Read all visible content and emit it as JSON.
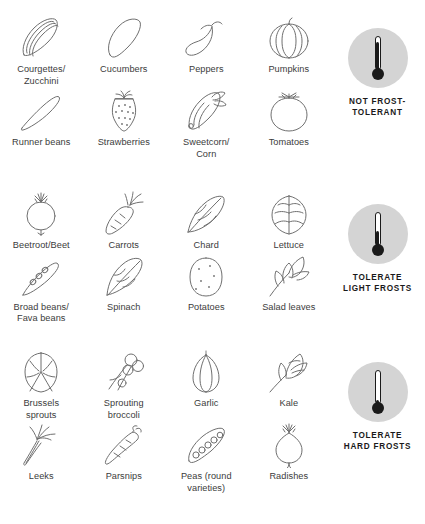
{
  "colors": {
    "stroke": "#6f6f6f",
    "text": "#3b3b3b",
    "legend_text": "#1a1a1a",
    "circle_bg": "#d4d4d4",
    "mercury": "#1a1a1a",
    "background": "#ffffff"
  },
  "sections": [
    {
      "id": "not-frost-tolerant",
      "legend": {
        "label": "NOT FROST-\nTOLERANT",
        "thermometer_level_percent": 95,
        "icon": "thermometer-hot-icon"
      },
      "items": [
        {
          "name": "courgettes-zucchini",
          "label": "Courgettes/\nZucchini",
          "icon": "courgette-icon"
        },
        {
          "name": "cucumbers",
          "label": "Cucumbers",
          "icon": "cucumber-icon"
        },
        {
          "name": "peppers",
          "label": "Peppers",
          "icon": "pepper-icon"
        },
        {
          "name": "pumpkins",
          "label": "Pumpkins",
          "icon": "pumpkin-icon"
        },
        {
          "name": "runner-beans",
          "label": "Runner beans",
          "icon": "runner-bean-icon"
        },
        {
          "name": "strawberries",
          "label": "Strawberries",
          "icon": "strawberry-icon"
        },
        {
          "name": "sweetcorn",
          "label": "Sweetcorn/\nCorn",
          "icon": "corn-icon"
        },
        {
          "name": "tomatoes",
          "label": "Tomatoes",
          "icon": "tomato-icon"
        }
      ]
    },
    {
      "id": "tolerate-light-frosts",
      "legend": {
        "label": "TOLERATE\nLIGHT FROSTS",
        "thermometer_level_percent": 48,
        "icon": "thermometer-mild-icon"
      },
      "items": [
        {
          "name": "beetroot-beet",
          "label": "Beetroot/Beet",
          "icon": "beetroot-icon"
        },
        {
          "name": "carrots",
          "label": "Carrots",
          "icon": "carrot-icon"
        },
        {
          "name": "chard",
          "label": "Chard",
          "icon": "chard-icon"
        },
        {
          "name": "lettuce",
          "label": "Lettuce",
          "icon": "lettuce-icon"
        },
        {
          "name": "broad-beans",
          "label": "Broad beans/\nFava beans",
          "icon": "broad-bean-icon"
        },
        {
          "name": "spinach",
          "label": "Spinach",
          "icon": "spinach-icon"
        },
        {
          "name": "potatoes",
          "label": "Potatoes",
          "icon": "potato-icon"
        },
        {
          "name": "salad-leaves",
          "label": "Salad leaves",
          "icon": "salad-leaf-icon"
        }
      ]
    },
    {
      "id": "tolerate-hard-frosts",
      "legend": {
        "label": "TOLERATE\nHARD FROSTS",
        "thermometer_level_percent": 8,
        "icon": "thermometer-cold-icon"
      },
      "items": [
        {
          "name": "brussels-sprouts",
          "label": "Brussels\nsprouts",
          "icon": "brussels-sprout-icon"
        },
        {
          "name": "sprouting-broccoli",
          "label": "Sprouting\nbroccoli",
          "icon": "broccoli-icon"
        },
        {
          "name": "garlic",
          "label": "Garlic",
          "icon": "garlic-icon"
        },
        {
          "name": "kale",
          "label": "Kale",
          "icon": "kale-icon"
        },
        {
          "name": "leeks",
          "label": "Leeks",
          "icon": "leek-icon"
        },
        {
          "name": "parsnips",
          "label": "Parsnips",
          "icon": "parsnip-icon"
        },
        {
          "name": "peas",
          "label": "Peas (round\nvarieties)",
          "icon": "pea-pod-icon"
        },
        {
          "name": "radishes",
          "label": "Radishes",
          "icon": "radish-icon"
        }
      ]
    }
  ]
}
